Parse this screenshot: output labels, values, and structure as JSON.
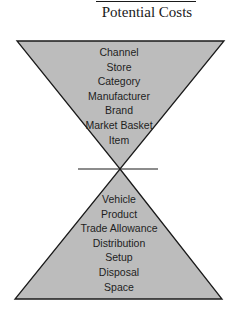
{
  "title": "Potential Costs",
  "colors": {
    "fill": "#bcbcbc",
    "stroke": "#1a1a1a",
    "text": "#1e1e1e",
    "background": "#ffffff"
  },
  "top_triangle": {
    "orientation": "inverted",
    "items": [
      {
        "label": "Channel"
      },
      {
        "label": "Store"
      },
      {
        "label": "Category"
      },
      {
        "label": "Manufacturer"
      },
      {
        "label": "Brand"
      },
      {
        "label": "Market Basket"
      },
      {
        "label": "Item"
      }
    ]
  },
  "bottom_triangle": {
    "orientation": "upright",
    "items": [
      {
        "label": "Vehicle"
      },
      {
        "label": "Product"
      },
      {
        "label": "Trade Allowance"
      },
      {
        "label": "Distribution"
      },
      {
        "label": "Setup"
      },
      {
        "label": "Disposal"
      },
      {
        "label": "Space"
      }
    ]
  }
}
